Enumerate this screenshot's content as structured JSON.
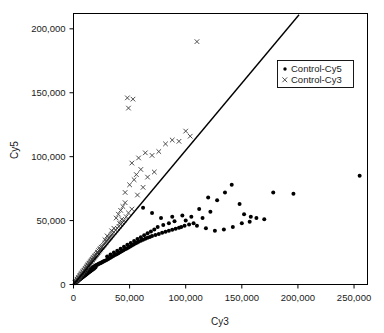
{
  "chart_data": {
    "type": "scatter",
    "title": "",
    "xlabel": "Cy3",
    "ylabel": "Cy5",
    "xlim": [
      0,
      262000
    ],
    "ylim": [
      0,
      212000
    ],
    "xticks": [
      0,
      50000,
      100000,
      150000,
      200000,
      250000
    ],
    "yticks": [
      0,
      50000,
      100000,
      150000,
      200000
    ],
    "xticklabels": [
      "0",
      "50,000",
      "100,000",
      "150,000",
      "200,000",
      "250,000"
    ],
    "yticklabels": [
      "0",
      "50,000",
      "100,000",
      "150,000",
      "200,000"
    ],
    "grid": false,
    "legend_position": "upper right",
    "reference_line": {
      "type": "line",
      "slope": 1.05,
      "intercept": 0,
      "x_start": 0,
      "y_start": 0,
      "x_end": 201000,
      "y_end": 211000,
      "color": "#000000"
    },
    "series": [
      {
        "name": "Control-Cy5",
        "marker": "dot",
        "color": "#000000",
        "points": [
          [
            1200,
            900
          ],
          [
            1800,
            1500
          ],
          [
            2100,
            1700
          ],
          [
            2600,
            2100
          ],
          [
            3000,
            2500
          ],
          [
            3400,
            2800
          ],
          [
            3900,
            3100
          ],
          [
            4300,
            3500
          ],
          [
            4800,
            3900
          ],
          [
            5200,
            4200
          ],
          [
            5700,
            4600
          ],
          [
            6100,
            4900
          ],
          [
            6600,
            5300
          ],
          [
            7000,
            5600
          ],
          [
            7500,
            6000
          ],
          [
            7900,
            6300
          ],
          [
            8400,
            6700
          ],
          [
            8800,
            7000
          ],
          [
            9300,
            7400
          ],
          [
            9700,
            7700
          ],
          [
            10200,
            8100
          ],
          [
            10600,
            8400
          ],
          [
            11100,
            8800
          ],
          [
            11500,
            9100
          ],
          [
            12000,
            9500
          ],
          [
            12400,
            9800
          ],
          [
            12900,
            10200
          ],
          [
            13300,
            10500
          ],
          [
            13800,
            10900
          ],
          [
            14200,
            11200
          ],
          [
            14700,
            11600
          ],
          [
            15100,
            11900
          ],
          [
            15600,
            12300
          ],
          [
            16000,
            12600
          ],
          [
            16500,
            13000
          ],
          [
            17000,
            13200
          ],
          [
            17600,
            13600
          ],
          [
            18200,
            13900
          ],
          [
            18800,
            14300
          ],
          [
            19400,
            14600
          ],
          [
            20000,
            15000
          ],
          [
            20800,
            15300
          ],
          [
            21500,
            15700
          ],
          [
            22200,
            16000
          ],
          [
            23000,
            16400
          ],
          [
            23800,
            16700
          ],
          [
            24600,
            17100
          ],
          [
            25400,
            17400
          ],
          [
            26200,
            17800
          ],
          [
            27000,
            18100
          ],
          [
            1500,
            1100
          ],
          [
            2300,
            1900
          ],
          [
            3100,
            2400
          ],
          [
            3800,
            2900
          ],
          [
            4500,
            3400
          ],
          [
            5300,
            3900
          ],
          [
            6000,
            4400
          ],
          [
            6800,
            4900
          ],
          [
            7600,
            5400
          ],
          [
            8300,
            5900
          ],
          [
            9100,
            6400
          ],
          [
            9800,
            6900
          ],
          [
            10600,
            7400
          ],
          [
            11300,
            7900
          ],
          [
            12100,
            8400
          ],
          [
            12800,
            8900
          ],
          [
            13600,
            9400
          ],
          [
            14300,
            9900
          ],
          [
            15100,
            10400
          ],
          [
            15800,
            10900
          ],
          [
            16600,
            11400
          ],
          [
            17300,
            11900
          ],
          [
            18100,
            12400
          ],
          [
            18800,
            12900
          ],
          [
            19600,
            13400
          ],
          [
            2000,
            1300
          ],
          [
            2800,
            2000
          ],
          [
            3600,
            2600
          ],
          [
            4400,
            3200
          ],
          [
            5200,
            3800
          ],
          [
            6000,
            4300
          ],
          [
            6800,
            4900
          ],
          [
            7600,
            5500
          ],
          [
            8400,
            6100
          ],
          [
            9200,
            6600
          ],
          [
            10000,
            7200
          ],
          [
            10800,
            7800
          ],
          [
            11600,
            8400
          ],
          [
            12400,
            8900
          ],
          [
            13200,
            9500
          ],
          [
            14000,
            10100
          ],
          [
            14800,
            10700
          ],
          [
            15600,
            11200
          ],
          [
            16400,
            11800
          ],
          [
            17200,
            12400
          ],
          [
            28000,
            18500
          ],
          [
            29500,
            19200
          ],
          [
            31000,
            20000
          ],
          [
            32500,
            20700
          ],
          [
            34000,
            21500
          ],
          [
            35500,
            22200
          ],
          [
            37000,
            23000
          ],
          [
            38500,
            23700
          ],
          [
            40000,
            24500
          ],
          [
            41500,
            25200
          ],
          [
            43000,
            26000
          ],
          [
            44500,
            26700
          ],
          [
            46000,
            27500
          ],
          [
            47500,
            28200
          ],
          [
            49000,
            29000
          ],
          [
            50500,
            29700
          ],
          [
            52000,
            30500
          ],
          [
            53500,
            31200
          ],
          [
            55000,
            32000
          ],
          [
            56500,
            32700
          ],
          [
            58000,
            33500
          ],
          [
            60000,
            34300
          ],
          [
            62000,
            35000
          ],
          [
            64000,
            35800
          ],
          [
            66000,
            36500
          ],
          [
            30000,
            22000
          ],
          [
            33000,
            23500
          ],
          [
            36000,
            25000
          ],
          [
            39000,
            26500
          ],
          [
            42000,
            28000
          ],
          [
            45000,
            29500
          ],
          [
            48000,
            31000
          ],
          [
            51000,
            32500
          ],
          [
            54000,
            34000
          ],
          [
            57000,
            35500
          ],
          [
            60000,
            37000
          ],
          [
            63000,
            38500
          ],
          [
            66000,
            40000
          ],
          [
            69000,
            41500
          ],
          [
            72000,
            43000
          ],
          [
            68000,
            37200
          ],
          [
            70000,
            38000
          ],
          [
            73000,
            38800
          ],
          [
            76000,
            39600
          ],
          [
            79000,
            40400
          ],
          [
            82000,
            41200
          ],
          [
            85000,
            42000
          ],
          [
            88000,
            42800
          ],
          [
            91000,
            43600
          ],
          [
            94000,
            44400
          ],
          [
            75000,
            45000
          ],
          [
            80000,
            46500
          ],
          [
            85000,
            48000
          ],
          [
            90000,
            49500
          ],
          [
            96000,
            45000
          ],
          [
            99000,
            46000
          ],
          [
            103000,
            47000
          ],
          [
            107000,
            48000
          ],
          [
            62000,
            60000
          ],
          [
            70000,
            56000
          ],
          [
            78000,
            52000
          ],
          [
            88000,
            53000
          ],
          [
            97000,
            54000
          ],
          [
            105000,
            53000
          ],
          [
            115000,
            52000
          ],
          [
            122000,
            57000
          ],
          [
            128000,
            66000
          ],
          [
            135000,
            72000
          ],
          [
            141000,
            78000
          ],
          [
            148000,
            63000
          ],
          [
            152000,
            55000
          ],
          [
            158000,
            53000
          ],
          [
            163000,
            52000
          ],
          [
            150000,
            48000
          ],
          [
            157000,
            49000
          ],
          [
            170000,
            51000
          ],
          [
            178000,
            72000
          ],
          [
            196000,
            71000
          ],
          [
            255000,
            85000
          ],
          [
            100000,
            50000
          ],
          [
            110000,
            46000
          ],
          [
            118000,
            44000
          ],
          [
            126000,
            42000
          ],
          [
            134000,
            43000
          ],
          [
            142000,
            45000
          ],
          [
            112000,
            59000
          ],
          [
            120000,
            68000
          ]
        ]
      },
      {
        "name": "Control-Cy3",
        "marker": "cross",
        "color": "#3a3a3a",
        "points": [
          [
            1300,
            1400
          ],
          [
            1900,
            2100
          ],
          [
            2500,
            2800
          ],
          [
            3100,
            3500
          ],
          [
            3700,
            4200
          ],
          [
            4300,
            4900
          ],
          [
            4900,
            5600
          ],
          [
            5500,
            6300
          ],
          [
            6100,
            7000
          ],
          [
            6700,
            7700
          ],
          [
            7300,
            8400
          ],
          [
            7900,
            9100
          ],
          [
            8500,
            9800
          ],
          [
            9100,
            10500
          ],
          [
            9700,
            11200
          ],
          [
            10300,
            11900
          ],
          [
            10900,
            12600
          ],
          [
            11500,
            13300
          ],
          [
            12100,
            14000
          ],
          [
            12700,
            14700
          ],
          [
            13300,
            15400
          ],
          [
            13900,
            16100
          ],
          [
            14500,
            16800
          ],
          [
            15100,
            17500
          ],
          [
            15700,
            18200
          ],
          [
            16300,
            18900
          ],
          [
            16900,
            19600
          ],
          [
            17500,
            20300
          ],
          [
            18100,
            21000
          ],
          [
            18700,
            21700
          ],
          [
            19500,
            22600
          ],
          [
            20300,
            23500
          ],
          [
            21100,
            24400
          ],
          [
            21900,
            25300
          ],
          [
            22700,
            26200
          ],
          [
            23500,
            27100
          ],
          [
            24300,
            28000
          ],
          [
            25100,
            28900
          ],
          [
            25900,
            29800
          ],
          [
            26700,
            30700
          ],
          [
            27500,
            31600
          ],
          [
            28300,
            32500
          ],
          [
            29100,
            33400
          ],
          [
            29900,
            34300
          ],
          [
            30700,
            35200
          ],
          [
            31500,
            36100
          ],
          [
            32300,
            37000
          ],
          [
            33100,
            37900
          ],
          [
            33900,
            38800
          ],
          [
            34700,
            39700
          ],
          [
            2200,
            2600
          ],
          [
            3400,
            4000
          ],
          [
            4600,
            5400
          ],
          [
            5800,
            6800
          ],
          [
            7000,
            8200
          ],
          [
            8200,
            9600
          ],
          [
            9400,
            11000
          ],
          [
            10600,
            12400
          ],
          [
            11800,
            13800
          ],
          [
            13000,
            15200
          ],
          [
            14200,
            16600
          ],
          [
            15400,
            18000
          ],
          [
            16600,
            19400
          ],
          [
            17800,
            20800
          ],
          [
            19000,
            22200
          ],
          [
            20200,
            23600
          ],
          [
            21400,
            25000
          ],
          [
            22600,
            26400
          ],
          [
            23800,
            27800
          ],
          [
            25000,
            29200
          ],
          [
            36000,
            41000
          ],
          [
            37500,
            42500
          ],
          [
            39000,
            44000
          ],
          [
            40500,
            45500
          ],
          [
            42000,
            47000
          ],
          [
            43500,
            48500
          ],
          [
            45000,
            50000
          ],
          [
            38000,
            52000
          ],
          [
            40000,
            55000
          ],
          [
            42000,
            58000
          ],
          [
            44000,
            61000
          ],
          [
            46000,
            64000
          ],
          [
            41000,
            48000
          ],
          [
            43000,
            51000
          ],
          [
            47000,
            53000
          ],
          [
            49000,
            56000
          ],
          [
            52000,
            59000
          ],
          [
            46000,
            72000
          ],
          [
            50000,
            78000
          ],
          [
            54000,
            82000
          ],
          [
            56000,
            86000
          ],
          [
            60000,
            90000
          ],
          [
            52000,
            95000
          ],
          [
            58000,
            99000
          ],
          [
            64000,
            103000
          ],
          [
            70000,
            101000
          ],
          [
            76000,
            104000
          ],
          [
            82000,
            110000
          ],
          [
            88000,
            113000
          ],
          [
            94000,
            112000
          ],
          [
            100000,
            120000
          ],
          [
            104000,
            116000
          ],
          [
            48000,
            146000
          ],
          [
            53000,
            145000
          ],
          [
            49000,
            138000
          ],
          [
            110000,
            190000
          ],
          [
            36000,
            44000
          ],
          [
            34000,
            42000
          ],
          [
            30000,
            38000
          ],
          [
            28000,
            35000
          ],
          [
            66000,
            84000
          ],
          [
            72000,
            88000
          ],
          [
            62000,
            76000
          ],
          [
            57000,
            70000
          ]
        ]
      }
    ]
  },
  "legend": {
    "entries": [
      {
        "label": "Control-Cy5",
        "marker": "dot"
      },
      {
        "label": "Control-Cy3",
        "marker": "cross"
      }
    ]
  }
}
